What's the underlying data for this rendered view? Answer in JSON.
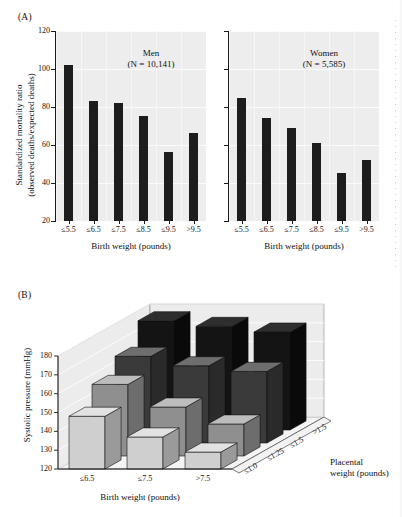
{
  "figure": {
    "panel_a_label": "(A)",
    "panel_b_label": "(B)"
  },
  "panel_a": {
    "ylabel_line1": "Standardized mortality ratio",
    "ylabel_line2": "(observed deaths/expected deaths)",
    "xlabel": "Birth weight (pounds)",
    "yticks": [
      "120",
      "100",
      "80",
      "60",
      "40",
      "20"
    ],
    "groups": [
      {
        "name": "Men",
        "title_line1": "Men",
        "title_line2": "(N = 10,141)",
        "n": "10,141"
      },
      {
        "name": "Women",
        "title_line1": "Women",
        "title_line2": "(N = 5,585)",
        "n": "5,585"
      }
    ],
    "categories": [
      "≤5.5",
      "≤6.5",
      "≤7.5",
      "≤8.5",
      "≤9.5",
      ">9.5"
    ]
  },
  "panel_b": {
    "ylabel": "Systolic pressure (mmHg)",
    "xlabel": "Birth weight (pounds)",
    "zlabel_line1": "Placental",
    "zlabel_line2": "weight (pounds)",
    "yticks": [
      "180",
      "170",
      "160",
      "150",
      "140",
      "130",
      "120"
    ],
    "xcategories": [
      "≤6.5",
      "≤7.5",
      ">7.5"
    ],
    "zcategories": [
      "≤1.0",
      "≤1.25",
      "≤1.5",
      ">1.5"
    ]
  },
  "colors": {
    "bar_dark": "#1d1d1d",
    "plot_bg": "#ededed",
    "gridline": "#fbfbfb",
    "axis": "#1a1a1a",
    "bar3d_light_top": "#d7d7d7",
    "bar3d_light_front": "#cfcfcf",
    "bar3d_light_side": "#9a9a9a",
    "bar3d_mid_front": "#8f8f8f",
    "bar3d_mid_side": "#6d6d6d",
    "bar3d_dark_front": "#3a3a3a",
    "bar3d_dark_side": "#2a2a2a",
    "bar3d_black_front": "#141414",
    "bar3d_black_side": "#0a0a0a",
    "wall": "#ececec",
    "floor": "#f4f4f4"
  },
  "chart_data": [
    {
      "type": "bar",
      "title": "(A) Standardized mortality ratio by birth weight",
      "xlabel": "Birth weight (pounds)",
      "ylabel": "Standardized mortality ratio (observed deaths/expected deaths)",
      "categories": [
        "≤5.5",
        "≤6.5",
        "≤7.5",
        "≤8.5",
        "≤9.5",
        ">9.5"
      ],
      "ylim": [
        20,
        120
      ],
      "yticks": [
        20,
        40,
        60,
        80,
        100,
        120
      ],
      "grid": true,
      "legend": "none",
      "series": [
        {
          "name": "Men (N = 10,141)",
          "values": [
            102,
            83,
            82,
            75.5,
            56.5,
            66.5
          ]
        },
        {
          "name": "Women (N = 5,585)",
          "values": [
            84.5,
            74,
            69,
            61,
            45.5,
            52
          ]
        }
      ]
    },
    {
      "type": "bar",
      "title": "(B) Systolic pressure by birth weight and placental weight",
      "projection": "3d",
      "xlabel": "Birth weight (pounds)",
      "ylabel": "Systolic pressure (mmHg)",
      "zlabel": "Placental weight (pounds)",
      "categories": [
        "≤6.5",
        "≤7.5",
        ">7.5"
      ],
      "zcategories": [
        "≤1.0",
        "≤1.25",
        "≤1.5",
        ">1.5"
      ],
      "ylim": [
        120,
        180
      ],
      "yticks": [
        120,
        130,
        140,
        150,
        160,
        170,
        180
      ],
      "grid": true,
      "series": [
        {
          "name": "≤1.0",
          "values": [
            148,
            137,
            129
          ]
        },
        {
          "name": "≤1.25",
          "values": [
            158,
            146,
            137
          ]
        },
        {
          "name": "≤1.5",
          "values": [
            166,
            161,
            158
          ]
        },
        {
          "name": ">1.5",
          "values": [
            178,
            175,
            172
          ]
        }
      ]
    }
  ]
}
